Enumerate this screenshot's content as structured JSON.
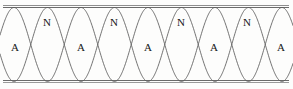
{
  "figure": {
    "width": 293,
    "height": 89,
    "background_color": "#fdfdfc",
    "curve_color": "#5a5a5a",
    "rail_color": "#6b6b6b",
    "text_color": "#161616"
  },
  "boundaries": {
    "top_rail": {
      "y": 6.5,
      "x_start": 3,
      "x_end": 289
    },
    "bottom_rail": {
      "y": 81.0,
      "x_start": 3,
      "x_end": 289
    }
  },
  "wave": {
    "description": "Two mirror-image sinusoidal envelope curves crossing at the nodes",
    "axis_y": 44.5,
    "amplitude": 37,
    "period_px": 67,
    "phase_offset_px": 14,
    "node_positions_x": [
      47,
      114,
      181,
      247
    ],
    "antinode_positions_x": [
      14,
      80,
      147,
      214,
      280
    ]
  },
  "labels": {
    "nodes": [
      {
        "text": "N",
        "x": 47,
        "y": 22
      },
      {
        "text": "N",
        "x": 114,
        "y": 22
      },
      {
        "text": "N",
        "x": 181,
        "y": 22
      },
      {
        "text": "N",
        "x": 247,
        "y": 22
      }
    ],
    "antinodes": [
      {
        "text": "A",
        "x": 15,
        "y": 47
      },
      {
        "text": "A",
        "x": 81,
        "y": 47
      },
      {
        "text": "A",
        "x": 148,
        "y": 47
      },
      {
        "text": "A",
        "x": 214,
        "y": 47
      },
      {
        "text": "A",
        "x": 281,
        "y": 47
      }
    ]
  },
  "legend_meaning": {
    "N": "node",
    "A": "antinode"
  }
}
